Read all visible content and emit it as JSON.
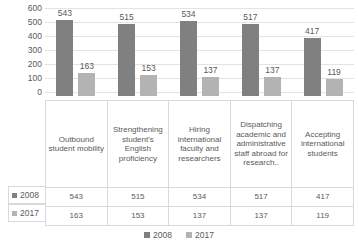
{
  "chart_data": {
    "type": "bar",
    "title": "",
    "xlabel": "",
    "ylabel": "",
    "ylim": [
      0,
      600
    ],
    "yticks": [
      "600",
      "500",
      "400",
      "300",
      "200",
      "100",
      "0"
    ],
    "grid": true,
    "legend_position": "bottom",
    "categories": [
      "Outbound student mobility",
      "Strengthening student's English proficiency",
      "Hiring international faculty and researchers",
      "Dispatching academic and administrative staff abroad for research..",
      "Accepting international students"
    ],
    "series": [
      {
        "name": "2008",
        "color": "#808080",
        "values": [
          543,
          515,
          534,
          517,
          417
        ]
      },
      {
        "name": "2017",
        "color": "#b3b3b3",
        "values": [
          163,
          153,
          137,
          137,
          119
        ]
      }
    ],
    "data_labels": {
      "2008": [
        "543",
        "515",
        "534",
        "517",
        "417"
      ],
      "2017": [
        "163",
        "153",
        "137",
        "137",
        "119"
      ]
    }
  },
  "legend": {
    "items": [
      {
        "label": "2008"
      },
      {
        "label": "2017"
      }
    ]
  },
  "table": {
    "row_headers": [
      "2008",
      "2017"
    ],
    "rows": [
      [
        "543",
        "515",
        "534",
        "517",
        "417"
      ],
      [
        "163",
        "153",
        "137",
        "137",
        "119"
      ]
    ]
  }
}
